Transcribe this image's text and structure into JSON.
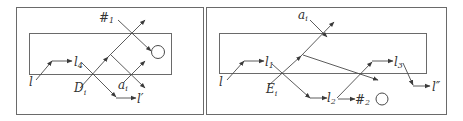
{
  "figure": {
    "panels": [
      {
        "id": "left",
        "labels": {
          "l": "l",
          "l4": "l",
          "l4_sub": "4",
          "D": "D",
          "D_sub": "i",
          "a": "a",
          "a_sub": "i",
          "lprime": "l′",
          "hash": "#",
          "hash_sub": "1"
        }
      },
      {
        "id": "right",
        "labels": {
          "l": "l",
          "l1": "l",
          "l1_sub": "1",
          "E": "E",
          "E_sub": "i",
          "a": "a",
          "a_sub": "i",
          "l2": "l",
          "l2_sub": "2",
          "hash": "#",
          "hash_sub": "2",
          "l3": "l",
          "l3_sub": "3",
          "ldoubleprime": "l″"
        }
      }
    ],
    "colors": {
      "stroke": "#4a4a4a",
      "box": "#6a6a6a",
      "text": "#333333",
      "background": "#ffffff"
    }
  }
}
